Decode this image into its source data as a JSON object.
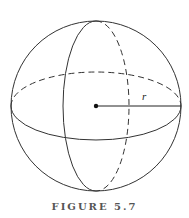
{
  "figure": {
    "caption": "FIGURE 5.7",
    "radius_label": "r"
  }
}
